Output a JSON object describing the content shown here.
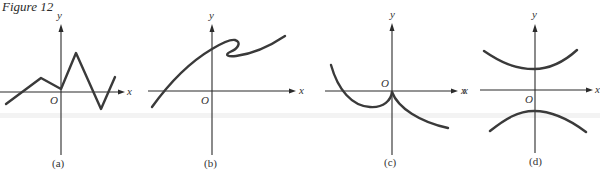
{
  "figure": {
    "title": "Figure 12"
  },
  "panels": [
    {
      "id": "a",
      "caption": "(a)",
      "x_label": "x",
      "y_label": "y",
      "origin_label": "O",
      "description": "Piecewise-linear zigzag graph of a function"
    },
    {
      "id": "b",
      "caption": "(b)",
      "x_label": "x",
      "y_label": "y",
      "origin_label": "O",
      "description": "Curve that folds back on itself (not a function)"
    },
    {
      "id": "c",
      "caption": "(c)",
      "x_label": "x",
      "y_label": "y",
      "origin_label": "O",
      "description": "Curve with a cusp at the origin"
    },
    {
      "id": "d",
      "caption": "(d)",
      "x_label": "x",
      "x_label_left": "x",
      "y_label": "y",
      "origin_label": "O",
      "description": "Two branches of a hyperbola opening up and down (not a function)"
    }
  ],
  "colors": {
    "ink": "#2b2b2b",
    "curve": "#3a3a3a",
    "background": "#ffffff"
  }
}
